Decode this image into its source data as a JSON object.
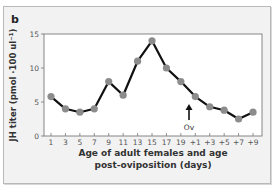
{
  "panel": {
    "label": "b"
  },
  "chart_data": {
    "type": "line",
    "title": "",
    "xlabel": "Age of adult females and age post-oviposition (days)",
    "xlabel_lines": [
      "Age of adult females and age",
      "post-oviposition (days)"
    ],
    "ylabel": "JH titer (pmol ·100 ul⁻¹)",
    "categories": [
      "1",
      "3",
      "5",
      "7",
      "9",
      "11",
      "13",
      "15",
      "17",
      "19",
      "+1",
      "+3",
      "+5",
      "+7",
      "+9"
    ],
    "series": [
      {
        "name": "JH titer",
        "values": [
          5.8,
          4.0,
          3.5,
          4.0,
          8.0,
          6.0,
          11.0,
          14.0,
          10.0,
          8.0,
          5.8,
          4.3,
          3.8,
          2.5,
          3.5
        ]
      }
    ],
    "ylim": [
      0,
      15
    ],
    "yticks": [
      0,
      5,
      10,
      15
    ],
    "grid": false,
    "legend": "none",
    "annotations": [
      {
        "text": "Ov",
        "type": "arrow",
        "position": "between 19 and +1",
        "meaning": "oviposition"
      }
    ]
  },
  "colors": {
    "line": "#111111",
    "marker": "#8c8c8c",
    "frame_bg": "#f2f2f2",
    "plot_bg": "#ffffff"
  }
}
